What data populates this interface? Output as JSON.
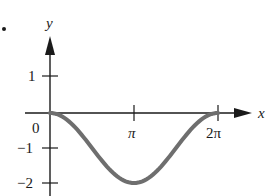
{
  "chart_data": {
    "type": "line",
    "title": "",
    "xlabel": "x",
    "ylabel": "y",
    "function": "y = cos(x) - 1",
    "x_ticks": [
      "0",
      "π",
      "2π"
    ],
    "x_tick_values": [
      0,
      3.14159,
      6.28319
    ],
    "y_ticks": [
      "1",
      "0",
      "-1",
      "-2"
    ],
    "y_tick_values": [
      1,
      0,
      -1,
      -2
    ],
    "xlim": [
      0,
      6.5
    ],
    "ylim": [
      -2.2,
      1.8
    ],
    "grid": false,
    "legend": null,
    "series": [
      {
        "name": "y = cos(x) - 1",
        "color": "#6e6e6e",
        "x": [
          0,
          0.785,
          1.571,
          2.356,
          3.142,
          3.927,
          4.712,
          5.498,
          6.283
        ],
        "values": [
          0,
          -0.293,
          -1,
          -1.707,
          -2,
          -1.707,
          -1,
          -0.293,
          0
        ]
      }
    ]
  },
  "labels": {
    "x_axis": "x",
    "y_axis": "y",
    "origin": "0",
    "pi": "π",
    "two_pi": "2π",
    "y_one": "1",
    "y_neg_one": "−1",
    "y_neg_two": "−2"
  },
  "colors": {
    "axis": "#1a1a1a",
    "curve": "#6e6e6e"
  }
}
